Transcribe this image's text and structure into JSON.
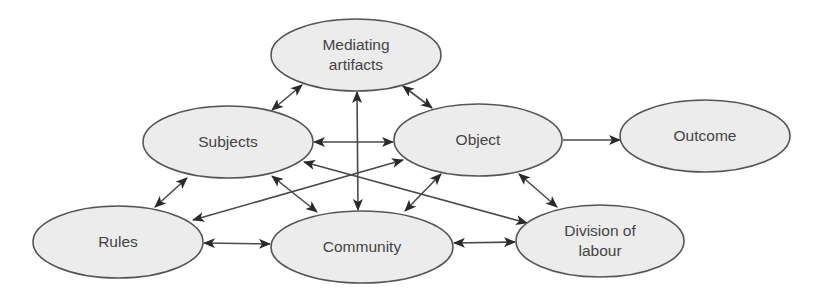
{
  "diagram": {
    "colors": {
      "node_fill": "#ececec",
      "node_stroke": "#555555",
      "edge": "#4a4a4a",
      "text": "#444444",
      "background": "#ffffff"
    },
    "nodes": [
      {
        "id": "mediating",
        "lines": [
          "Mediating",
          "artifacts"
        ],
        "cx": 356,
        "cy": 55,
        "rx": 85,
        "ry": 36
      },
      {
        "id": "subjects",
        "lines": [
          "Subjects"
        ],
        "cx": 228,
        "cy": 142,
        "rx": 85,
        "ry": 36
      },
      {
        "id": "object",
        "lines": [
          "Object"
        ],
        "cx": 478,
        "cy": 140,
        "rx": 84,
        "ry": 36
      },
      {
        "id": "outcome",
        "lines": [
          "Outcome"
        ],
        "cx": 705,
        "cy": 136,
        "rx": 85,
        "ry": 36
      },
      {
        "id": "rules",
        "lines": [
          "Rules"
        ],
        "cx": 118,
        "cy": 242,
        "rx": 85,
        "ry": 36
      },
      {
        "id": "community",
        "lines": [
          "Community"
        ],
        "cx": 362,
        "cy": 247,
        "rx": 91,
        "ry": 36
      },
      {
        "id": "division",
        "lines": [
          "Division of",
          "labour"
        ],
        "cx": 600,
        "cy": 241,
        "rx": 84,
        "ry": 36
      }
    ],
    "edges": [
      {
        "from": "mediating",
        "to": "subjects",
        "x1": 302,
        "y1": 85,
        "x2": 272,
        "y2": 110,
        "bidirectional": true
      },
      {
        "from": "mediating",
        "to": "object",
        "x1": 403,
        "y1": 86,
        "x2": 432,
        "y2": 108,
        "bidirectional": true
      },
      {
        "from": "mediating",
        "to": "community",
        "x1": 357,
        "y1": 92,
        "x2": 358,
        "y2": 210,
        "bidirectional": true
      },
      {
        "from": "subjects",
        "to": "object",
        "x1": 314,
        "y1": 142,
        "x2": 393,
        "y2": 142,
        "bidirectional": true
      },
      {
        "from": "object",
        "to": "outcome",
        "x1": 563,
        "y1": 140,
        "x2": 620,
        "y2": 140,
        "bidirectional": false
      },
      {
        "from": "subjects",
        "to": "rules",
        "x1": 187,
        "y1": 178,
        "x2": 155,
        "y2": 207,
        "bidirectional": true
      },
      {
        "from": "subjects",
        "to": "community",
        "x1": 272,
        "y1": 176,
        "x2": 317,
        "y2": 212,
        "bidirectional": true
      },
      {
        "from": "subjects",
        "to": "division",
        "x1": 304,
        "y1": 162,
        "x2": 527,
        "y2": 223,
        "bidirectional": true
      },
      {
        "from": "object",
        "to": "rules",
        "x1": 403,
        "y1": 160,
        "x2": 193,
        "y2": 220,
        "bidirectional": true
      },
      {
        "from": "object",
        "to": "community",
        "x1": 441,
        "y1": 174,
        "x2": 405,
        "y2": 211,
        "bidirectional": true
      },
      {
        "from": "object",
        "to": "division",
        "x1": 519,
        "y1": 174,
        "x2": 557,
        "y2": 207,
        "bidirectional": true
      },
      {
        "from": "rules",
        "to": "community",
        "x1": 204,
        "y1": 243,
        "x2": 270,
        "y2": 244,
        "bidirectional": true
      },
      {
        "from": "community",
        "to": "division",
        "x1": 454,
        "y1": 243,
        "x2": 515,
        "y2": 242,
        "bidirectional": true
      }
    ]
  }
}
